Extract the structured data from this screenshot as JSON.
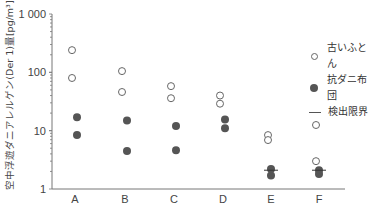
{
  "chart_data": {
    "type": "scatter",
    "title": "",
    "xlabel": "",
    "ylabel": "空中浮遊ダニアレルゲン(Der 1)量[pg/m³]",
    "yscale": "log",
    "ylim": [
      1,
      1000
    ],
    "yticks": [
      "1",
      "10",
      "100",
      "1 000"
    ],
    "categories": [
      "A",
      "B",
      "C",
      "D",
      "E",
      "F"
    ],
    "grid": false,
    "legend_position": "right",
    "series": [
      {
        "name": "古いふとん",
        "marker": "open-circle",
        "values": [
          [
            240,
            80
          ],
          [
            105,
            46
          ],
          [
            58,
            36
          ],
          [
            40,
            29
          ],
          [
            8.4,
            6.9
          ],
          [
            12.5,
            3.0
          ]
        ]
      },
      {
        "name": "抗ダニ布団",
        "marker": "filled-circle",
        "values": [
          [
            17,
            8.4
          ],
          [
            15,
            4.5
          ],
          [
            12,
            4.6
          ],
          [
            15.5,
            11
          ],
          [
            2.2,
            1.7
          ],
          [
            2.1,
            1.8
          ]
        ]
      },
      {
        "name": "検出限界",
        "marker": "line",
        "values": [
          null,
          null,
          null,
          null,
          2.1,
          2.1
        ]
      }
    ]
  },
  "legend": {
    "items": [
      {
        "label": "古いふとん"
      },
      {
        "label": "抗ダニ布団"
      },
      {
        "label": "検出限界"
      }
    ]
  },
  "colors": {
    "axis": "#777777",
    "open": "#666666",
    "filled": "#555555",
    "text": "#444444"
  }
}
